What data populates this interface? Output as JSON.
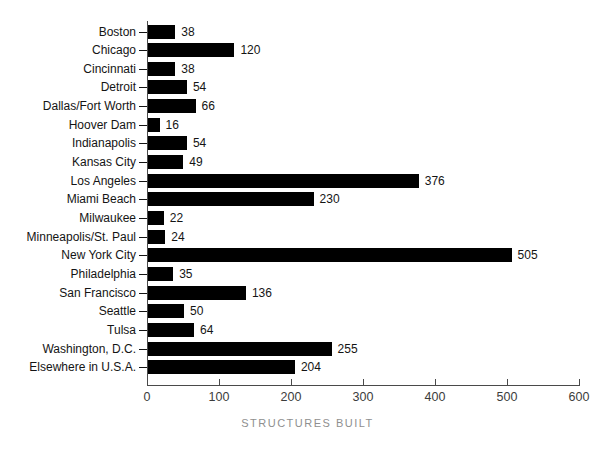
{
  "chart_data": {
    "type": "bar",
    "orientation": "horizontal",
    "title": "",
    "xlabel": "STRUCTURES BUILT",
    "ylabel": "",
    "categories": [
      "Boston",
      "Chicago",
      "Cincinnati",
      "Detroit",
      "Dallas/Fort Worth",
      "Hoover Dam",
      "Indianapolis",
      "Kansas City",
      "Los Angeles",
      "Miami Beach",
      "Milwaukee",
      "Minneapolis/St. Paul",
      "New York City",
      "Philadelphia",
      "San Francisco",
      "Seattle",
      "Tulsa",
      "Washington, D.C.",
      "Elsewhere in U.S.A."
    ],
    "values": [
      38,
      120,
      38,
      54,
      66,
      16,
      54,
      49,
      376,
      230,
      22,
      24,
      505,
      35,
      136,
      50,
      64,
      255,
      204
    ],
    "xlim": [
      0,
      600
    ],
    "xticks": [
      0,
      100,
      200,
      300,
      400,
      500,
      600
    ],
    "grid": false,
    "legend": false,
    "value_labels_shown": true,
    "bar_color": "#000000",
    "background_color": "#ffffff",
    "text_color": "#141414",
    "axis_color": "#4a4a4a",
    "axis_title_color": "#8f8f8f"
  }
}
